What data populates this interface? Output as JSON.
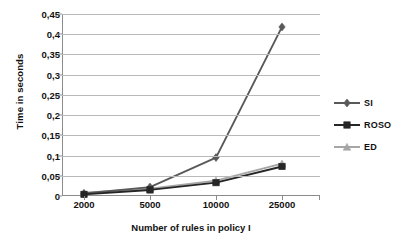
{
  "chart_data": {
    "type": "line",
    "title": "",
    "xlabel": "Number of rules in policy I",
    "ylabel": "Time in seconds",
    "categories": [
      "2000",
      "5000",
      "10000",
      "25000"
    ],
    "ylim": [
      0,
      0.45
    ],
    "ytick_step": 0.05,
    "ytick_labels": [
      "0,45",
      "0,4",
      "0,35",
      "0,3",
      "0,25",
      "0,2",
      "0,15",
      "0,1",
      "0,05",
      "0"
    ],
    "ytick_values": [
      0.45,
      0.4,
      0.35,
      0.3,
      0.25,
      0.2,
      0.15,
      0.1,
      0.05,
      0
    ],
    "grid": true,
    "legend_position": "right",
    "decimal_separator": ",",
    "series": [
      {
        "name": "SI",
        "color": "#595959",
        "marker": "diamond",
        "values": [
          0.006,
          0.022,
          0.095,
          0.418
        ]
      },
      {
        "name": "ROSO",
        "color": "#262626",
        "marker": "square",
        "values": [
          0.004,
          0.015,
          0.033,
          0.073
        ]
      },
      {
        "name": "ED",
        "color": "#a6a6a6",
        "marker": "triangle",
        "values": [
          0.008,
          0.018,
          0.038,
          0.08
        ]
      }
    ]
  },
  "colors": {
    "grid": "#b9b9b9",
    "axis": "#8c8c8c",
    "text": "#111111",
    "background": "#ffffff"
  }
}
